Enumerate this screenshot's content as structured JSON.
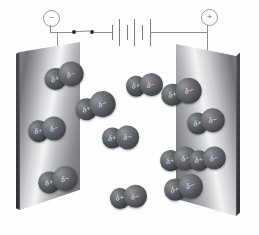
{
  "figure": {
    "name": "polar-molecule-alignment-between-charged-plates",
    "background_color": "#fefefe"
  },
  "circuit": {
    "negative_terminal_label": "−",
    "positive_terminal_label": "+",
    "switch": {
      "name": "switch",
      "contact_count": 2
    },
    "battery": {
      "name": "battery",
      "cell_count": 3,
      "plate_count": 6
    },
    "wire_color": "#8e8e8e"
  },
  "plates": [
    {
      "name": "negative-plate",
      "charge_label": "−",
      "side": "left"
    },
    {
      "name": "positive-plate",
      "charge_label": "+",
      "side": "right"
    }
  ],
  "molecule": {
    "positive_pole_label": "δ+",
    "negative_pole_label": "δ−",
    "sphere_color": "#4e5156"
  },
  "molecules": [
    {
      "id": 1,
      "x": 44,
      "y": 64,
      "rot": -16,
      "scale": 1.0
    },
    {
      "id": 2,
      "x": 75,
      "y": 94,
      "rot": -18,
      "scale": 1.02
    },
    {
      "id": 3,
      "x": 28,
      "y": 118,
      "rot": -10,
      "scale": 0.96
    },
    {
      "id": 4,
      "x": 38,
      "y": 168,
      "rot": -12,
      "scale": 1.0
    },
    {
      "id": 5,
      "x": 126,
      "y": 74,
      "rot": -6,
      "scale": 0.92
    },
    {
      "id": 6,
      "x": 102,
      "y": 126,
      "rot": -4,
      "scale": 0.94
    },
    {
      "id": 7,
      "x": 110,
      "y": 186,
      "rot": -8,
      "scale": 0.92
    },
    {
      "id": 8,
      "x": 160,
      "y": 148,
      "rot": -10,
      "scale": 0.94
    },
    {
      "id": 9,
      "x": 161,
      "y": 80,
      "rot": -14,
      "scale": 1.04
    },
    {
      "id": 10,
      "x": 187,
      "y": 110,
      "rot": -12,
      "scale": 0.96
    },
    {
      "id": 11,
      "x": 189,
      "y": 148,
      "rot": -10,
      "scale": 0.92
    },
    {
      "id": 12,
      "x": 164,
      "y": 176,
      "rot": -14,
      "scale": 0.98
    }
  ]
}
